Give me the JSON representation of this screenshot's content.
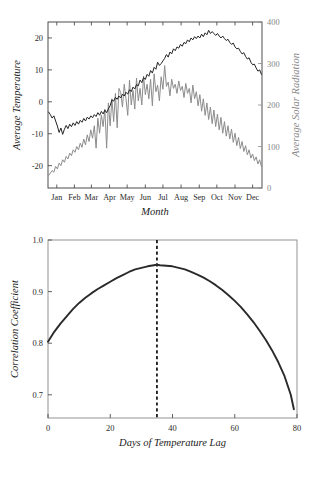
{
  "figure": {
    "panels": [
      "climate-timeseries",
      "lag-correlation"
    ]
  },
  "chart_data": [
    {
      "id": "climate-timeseries",
      "type": "line",
      "title": "",
      "xlabel": "Month",
      "ylabel": "Average Temperature",
      "y2label": "Average Solar Radiation",
      "grid": false,
      "legend": "none",
      "xlim": [
        0,
        365
      ],
      "xtick_labels": [
        "Jan",
        "Feb",
        "Mar",
        "Apr",
        "May",
        "Jun",
        "Jul",
        "Aug",
        "Sep",
        "Oct",
        "Nov",
        "Dec"
      ],
      "xtick_positions": [
        15,
        45,
        74,
        105,
        135,
        166,
        196,
        227,
        258,
        288,
        319,
        349
      ],
      "ylim": [
        -27,
        25
      ],
      "ytick_labels": [
        "-20",
        "-10",
        "0",
        "10",
        "20"
      ],
      "ytick_values": [
        -20,
        -10,
        0,
        10,
        20
      ],
      "y2lim": [
        0,
        400
      ],
      "y2tick_labels": [
        "0",
        "100",
        "200",
        "300",
        "400"
      ],
      "y2tick_values": [
        0,
        100,
        200,
        300,
        400
      ],
      "colors": {
        "temperature": "#232323",
        "solar": "#8c8c8c"
      },
      "series": [
        {
          "name": "Average Temperature",
          "axis": "left",
          "units": "degrees Celsius",
          "color": "#232323",
          "x": [
            1,
            4,
            7,
            10,
            13,
            16,
            19,
            22,
            25,
            28,
            31,
            34,
            37,
            40,
            43,
            46,
            49,
            52,
            55,
            58,
            61,
            64,
            67,
            70,
            73,
            76,
            79,
            82,
            85,
            88,
            91,
            94,
            97,
            100,
            103,
            106,
            109,
            112,
            115,
            118,
            121,
            124,
            127,
            130,
            133,
            136,
            139,
            142,
            145,
            148,
            151,
            154,
            157,
            160,
            163,
            166,
            169,
            172,
            175,
            178,
            181,
            184,
            187,
            190,
            193,
            196,
            199,
            202,
            205,
            208,
            211,
            214,
            217,
            220,
            223,
            226,
            229,
            232,
            235,
            238,
            241,
            244,
            247,
            250,
            253,
            256,
            259,
            262,
            265,
            268,
            271,
            274,
            277,
            280,
            283,
            286,
            289,
            292,
            295,
            298,
            301,
            304,
            307,
            310,
            313,
            316,
            319,
            322,
            325,
            328,
            331,
            334,
            337,
            340,
            343,
            346,
            349,
            352,
            355,
            358,
            361,
            364
          ],
          "y": [
            -3.2,
            -4.0,
            -5.1,
            -4.4,
            -6.0,
            -7.6,
            -9.6,
            -8.2,
            -10.2,
            -8.6,
            -7.4,
            -8.4,
            -7.0,
            -7.8,
            -6.6,
            -7.4,
            -6.2,
            -7.0,
            -5.8,
            -6.4,
            -5.2,
            -6.0,
            -4.8,
            -5.4,
            -4.4,
            -5.0,
            -4.0,
            -4.6,
            -3.4,
            -4.2,
            -3.0,
            -3.8,
            -2.6,
            -3.4,
            -2.2,
            -1.2,
            0.6,
            0.2,
            1.4,
            0.8,
            1.8,
            1.2,
            2.4,
            1.8,
            3.0,
            2.4,
            3.8,
            3.2,
            4.6,
            4.0,
            5.4,
            5.0,
            6.8,
            6.0,
            7.6,
            7.0,
            8.6,
            8.0,
            9.8,
            9.0,
            10.8,
            10.2,
            12.4,
            11.4,
            12.0,
            12.8,
            13.6,
            14.8,
            14.0,
            15.6,
            15.0,
            16.6,
            16.0,
            17.2,
            16.8,
            18.0,
            17.4,
            18.6,
            18.2,
            19.4,
            18.8,
            20.0,
            19.4,
            20.4,
            19.8,
            20.6,
            20.0,
            21.2,
            20.4,
            21.6,
            21.0,
            22.4,
            21.4,
            22.0,
            21.4,
            20.8,
            21.4,
            20.6,
            20.0,
            20.6,
            19.8,
            19.2,
            19.6,
            18.6,
            18.0,
            18.4,
            17.2,
            16.6,
            16.8,
            15.8,
            15.0,
            15.4,
            14.2,
            13.4,
            13.8,
            12.4,
            11.6,
            11.8,
            10.6,
            9.6,
            10.0,
            8.6,
            7.6,
            7.8,
            6.4,
            5.2
          ]
        },
        {
          "name": "Average Solar Radiation",
          "axis": "right",
          "units": "W/m2",
          "color": "#8c8c8c",
          "x": [
            1,
            4,
            7,
            10,
            13,
            16,
            19,
            22,
            25,
            28,
            31,
            34,
            37,
            40,
            43,
            46,
            49,
            52,
            55,
            58,
            61,
            64,
            67,
            70,
            73,
            76,
            79,
            82,
            85,
            88,
            91,
            94,
            97,
            100,
            103,
            106,
            109,
            112,
            115,
            118,
            121,
            124,
            127,
            130,
            133,
            136,
            139,
            142,
            145,
            148,
            151,
            154,
            157,
            160,
            163,
            166,
            169,
            172,
            175,
            178,
            181,
            184,
            187,
            190,
            193,
            196,
            199,
            202,
            205,
            208,
            211,
            214,
            217,
            220,
            223,
            226,
            229,
            232,
            235,
            238,
            241,
            244,
            247,
            250,
            253,
            256,
            259,
            262,
            265,
            268,
            271,
            274,
            277,
            280,
            283,
            286,
            289,
            292,
            295,
            298,
            301,
            304,
            307,
            310,
            313,
            316,
            319,
            322,
            325,
            328,
            331,
            334,
            337,
            340,
            343,
            346,
            349,
            352,
            355,
            358,
            361,
            364
          ],
          "y": [
            30,
            36,
            42,
            38,
            52,
            46,
            60,
            54,
            68,
            62,
            76,
            70,
            84,
            78,
            92,
            86,
            100,
            92,
            108,
            98,
            118,
            104,
            128,
            112,
            140,
            120,
            150,
            96,
            168,
            132,
            176,
            148,
            190,
            96,
            205,
            150,
            215,
            160,
            228,
            145,
            240,
            230,
            195,
            250,
            215,
            175,
            260,
            200,
            235,
            190,
            265,
            210,
            240,
            200,
            270,
            225,
            250,
            215,
            262,
            198,
            275,
            232,
            248,
            210,
            268,
            238,
            295,
            245,
            255,
            222,
            262,
            240,
            250,
            228,
            258,
            235,
            245,
            218,
            252,
            228,
            240,
            205,
            248,
            215,
            232,
            198,
            225,
            185,
            215,
            175,
            205,
            165,
            195,
            155,
            188,
            148,
            178,
            140,
            170,
            132,
            160,
            125,
            150,
            118,
            142,
            110,
            132,
            102,
            122,
            95,
            112,
            88,
            102,
            80,
            92,
            72,
            82,
            66,
            75,
            58,
            68,
            52
          ]
        }
      ]
    },
    {
      "id": "lag-correlation",
      "type": "line",
      "title": "",
      "xlabel": "Days of Temperature Lag",
      "ylabel": "Correlation Coefficient",
      "grid": false,
      "legend": "none",
      "xlim": [
        0,
        80
      ],
      "xtick_labels": [
        "0",
        "20",
        "40",
        "60",
        "80"
      ],
      "xtick_values": [
        0,
        20,
        40,
        60,
        80
      ],
      "ylim": [
        0.655,
        1.0
      ],
      "ytick_labels": [
        "0.7",
        "0.8",
        "0.9",
        "1.0"
      ],
      "ytick_values": [
        0.7,
        0.8,
        0.9,
        1.0
      ],
      "colors": {
        "curve": "#2a2a2a",
        "marker_line": "#1a1a1a"
      },
      "annotations": [
        {
          "type": "vertical-dashed-line",
          "name": "peak-lag-marker",
          "x": 35,
          "label": ""
        }
      ],
      "series": [
        {
          "name": "Correlation Coefficient",
          "color": "#2a2a2a",
          "x": [
            0,
            2,
            4,
            6,
            8,
            10,
            12,
            14,
            16,
            18,
            20,
            22,
            24,
            26,
            28,
            30,
            32,
            34,
            35,
            36,
            38,
            40,
            42,
            44,
            46,
            48,
            50,
            52,
            54,
            56,
            58,
            60,
            62,
            64,
            66,
            68,
            70,
            72,
            74,
            76,
            78,
            79
          ],
          "y": [
            0.803,
            0.822,
            0.838,
            0.852,
            0.866,
            0.878,
            0.888,
            0.897,
            0.905,
            0.912,
            0.919,
            0.926,
            0.932,
            0.938,
            0.943,
            0.946,
            0.949,
            0.951,
            0.952,
            0.951,
            0.95,
            0.949,
            0.946,
            0.943,
            0.938,
            0.933,
            0.927,
            0.92,
            0.912,
            0.903,
            0.893,
            0.882,
            0.87,
            0.856,
            0.841,
            0.824,
            0.806,
            0.786,
            0.763,
            0.736,
            0.7,
            0.672
          ]
        }
      ]
    }
  ]
}
